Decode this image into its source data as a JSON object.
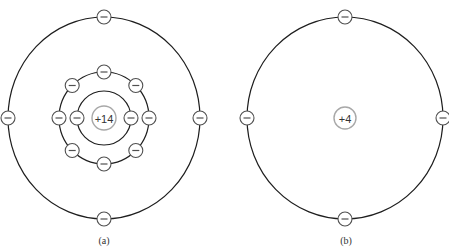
{
  "figure": {
    "panels": [
      {
        "id": "a",
        "caption": "(a)",
        "nucleus_label": "+14",
        "center": [
          104,
          118
        ],
        "nucleus_radius": 12,
        "shells": [
          {
            "name": "first-shell",
            "rx": 27,
            "ry": 27,
            "electrons": 2,
            "start_angle_deg": 0
          },
          {
            "name": "second-shell",
            "rx": 45,
            "ry": 46,
            "electrons": 8,
            "start_angle_deg": 0
          },
          {
            "name": "valence-shell",
            "rx": 96,
            "ry": 101,
            "electrons": 4,
            "start_angle_deg": 0
          }
        ]
      },
      {
        "id": "b",
        "caption": "(b)",
        "nucleus_label": "+4",
        "center": [
          345,
          118
        ],
        "nucleus_radius": 11,
        "shells": [
          {
            "name": "valence-shell",
            "rx": 98,
            "ry": 101,
            "electrons": 4,
            "start_angle_deg": 0
          }
        ]
      }
    ],
    "electron_radius": 7,
    "electron_symbol": "minus",
    "colors": {
      "orbit": "#1e1e1e",
      "nucleus_ring": "#a8a8a8",
      "electron_ring": "#505050",
      "text": "#333333",
      "background": "#ffffff"
    }
  }
}
